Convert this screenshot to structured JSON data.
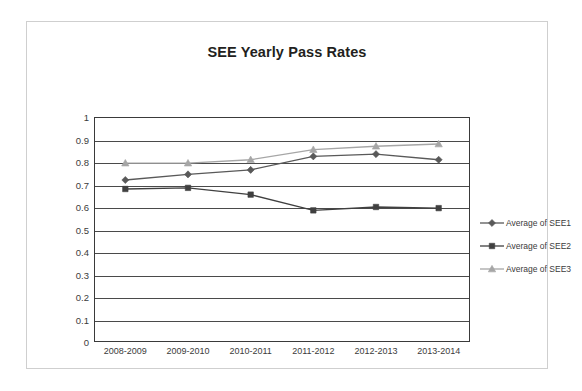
{
  "chart_data": {
    "type": "line",
    "title": "SEE Yearly Pass Rates",
    "xlabel": "",
    "ylabel": "",
    "categories": [
      "2008-2009",
      "2009-2010",
      "2010-2011",
      "2011-2012",
      "2012-2013",
      "2013-2014"
    ],
    "series": [
      {
        "name": "Average of SEE1",
        "marker": "diamond",
        "color": "#595959",
        "values": [
          0.72,
          0.745,
          0.765,
          0.825,
          0.835,
          0.81
        ]
      },
      {
        "name": "Average of SEE2",
        "marker": "square",
        "color": "#404040",
        "values": [
          0.68,
          0.685,
          0.655,
          0.585,
          0.6,
          0.595
        ]
      },
      {
        "name": "Average of SEE3",
        "marker": "triangle",
        "color": "#a6a6a6",
        "values": [
          0.795,
          0.795,
          0.81,
          0.855,
          0.87,
          0.88
        ]
      }
    ],
    "ylim": [
      0,
      1
    ],
    "ytick_labels": [
      "1",
      "0.9",
      "0.8",
      "0.7",
      "0.6",
      "0.5",
      "0.4",
      "0.3",
      "0.2",
      "0.1",
      "0"
    ],
    "ytick_values": [
      1,
      0.9,
      0.8,
      0.7,
      0.6,
      0.5,
      0.4,
      0.3,
      0.2,
      0.1,
      0
    ],
    "grid": true,
    "legend_position": "right"
  },
  "legend": {
    "items": [
      {
        "label": "Average of SEE1"
      },
      {
        "label": "Average of SEE2"
      },
      {
        "label": "Average of SEE3"
      }
    ]
  }
}
